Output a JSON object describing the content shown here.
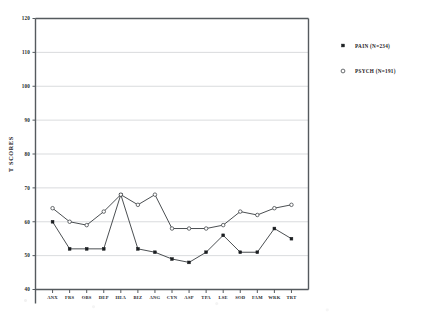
{
  "chart_data": {
    "type": "line",
    "title": "",
    "xlabel": "",
    "ylabel": "T SCORES",
    "ylim": [
      40,
      120
    ],
    "yticks": [
      40,
      50,
      60,
      70,
      80,
      90,
      100,
      110,
      120
    ],
    "grid": true,
    "legend_position": "right",
    "categories": [
      "ANX",
      "FRS",
      "OBS",
      "DEP",
      "HEA",
      "BIZ",
      "ANG",
      "CYN",
      "ASP",
      "TPA",
      "LSE",
      "SOD",
      "FAM",
      "WRK",
      "TRT"
    ],
    "series": [
      {
        "name": "PAIN",
        "label": "PAIN  (N=234)",
        "n": 234,
        "marker": "filled-circle",
        "values": [
          60,
          52,
          52,
          52,
          68,
          52,
          51,
          49,
          48,
          51,
          56,
          51,
          51,
          58,
          55
        ]
      },
      {
        "name": "PSYCH",
        "label": "PSYCH (N=191)",
        "n": 191,
        "marker": "open-circle",
        "values": [
          64,
          60,
          59,
          63,
          68,
          65,
          68,
          58,
          58,
          58,
          59,
          63,
          62,
          64,
          65
        ]
      }
    ]
  },
  "legend": {
    "entries": [
      {
        "label": "PAIN  (N=234)",
        "marker": "filled-circle"
      },
      {
        "label": "PSYCH (N=191)",
        "marker": "open-circle"
      }
    ]
  },
  "axes": {
    "y_title": "T SCORES",
    "y_tick_labels": [
      "120",
      "110",
      "100",
      "90",
      "80",
      "70",
      "60",
      "50",
      "40"
    ],
    "x_tick_labels": [
      "ANX",
      "FRS",
      "OBS",
      "DEP",
      "HEA",
      "BIZ",
      "ANG",
      "CYN",
      "ASP",
      "TPA",
      "LSE",
      "SOD",
      "FAM",
      "WRK",
      "TRT"
    ]
  },
  "colors": {
    "axis": "#555a5e",
    "grid": "#c9cccf",
    "series_line": "#2b2f33",
    "marker_fill": "#1b1e21",
    "marker_open": "#ffffff",
    "text": "#1d2023"
  }
}
